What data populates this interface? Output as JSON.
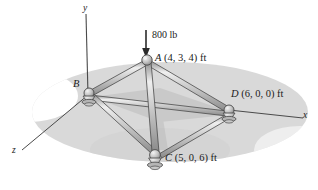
{
  "figure": {
    "background_color": "#ffffff",
    "ground_color": "#d6d6d6",
    "member_color": "#b9b9b9",
    "outline_color": "#3a3a3a",
    "text_color": "#1b1b1b"
  },
  "axes": [
    {
      "name": "y-axis",
      "label": "y"
    },
    {
      "name": "x-axis",
      "label": "x"
    },
    {
      "name": "z-axis",
      "label": "z"
    }
  ],
  "load": {
    "label": "800 lb",
    "magnitude": 800,
    "unit": "lb",
    "direction": "down",
    "applied_at": "A"
  },
  "joints": [
    {
      "id": "A",
      "label": "A (4, 3, 4) ft",
      "letter": "A",
      "coords": "(4, 3, 4) ft",
      "x": 4,
      "y": 3,
      "z": 4,
      "px": 148,
      "py": 60
    },
    {
      "id": "B",
      "label": "B",
      "letter": "B",
      "coords": "",
      "px": 88,
      "py": 93
    },
    {
      "id": "C",
      "label": "C (5, 0, 6) ft",
      "letter": "C",
      "coords": "(5, 0, 6) ft",
      "x": 5,
      "y": 0,
      "z": 6,
      "px": 155,
      "py": 157
    },
    {
      "id": "D",
      "label": "D (6, 0, 0) ft",
      "letter": "D",
      "coords": "(6, 0, 0) ft",
      "x": 6,
      "y": 0,
      "z": 0,
      "px": 229,
      "py": 110
    }
  ],
  "members": [
    {
      "name": "member-AB",
      "from": "A",
      "to": "B"
    },
    {
      "name": "member-AD",
      "from": "A",
      "to": "D"
    },
    {
      "name": "member-AC",
      "from": "A",
      "to": "C"
    },
    {
      "name": "member-BD",
      "from": "B",
      "to": "D"
    },
    {
      "name": "member-BC",
      "from": "B",
      "to": "C"
    },
    {
      "name": "member-CD",
      "from": "C",
      "to": "D"
    }
  ],
  "labels": {
    "A": "A (4, 3, 4) ft",
    "A_letter": "A",
    "A_coords": "(4, 3, 4) ft",
    "B": "B",
    "C_letter": "C",
    "C_coords": "(5, 0, 6) ft",
    "D_letter": "D",
    "D_coords": "(6, 0, 0) ft",
    "force": "800 lb",
    "axis_x": "x",
    "axis_y": "y",
    "axis_z": "z"
  }
}
